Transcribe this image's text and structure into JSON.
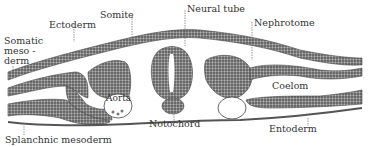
{
  "diagram": {
    "type": "anatomical cross-section",
    "colors": {
      "tissue": "#6a6a6a",
      "outline": "#444444",
      "label": "#333333"
    },
    "labels": {
      "ectoderm": "Ectoderm",
      "somite": "Somite",
      "neural_tube": "Neural tube",
      "nephrotome": "Nephrotome",
      "somatic_mesoderm_1": "Somatic",
      "somatic_mesoderm_2": "meso -",
      "somatic_mesoderm_3": "derm",
      "aorta": "Aorta",
      "coelom": "Coelom",
      "notochord": "Notochord",
      "splanchnic_mesoderm": "Splanchnic mesoderm",
      "entoderm": "Entoderm"
    }
  }
}
